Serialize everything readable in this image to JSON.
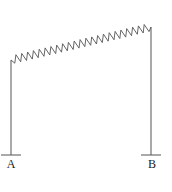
{
  "diagram": {
    "type": "spring-frame",
    "stroke_color": "#555555",
    "support_a": {
      "label": "A",
      "x": 11,
      "top_y": 60,
      "ground_y": 155
    },
    "support_b": {
      "label": "B",
      "x": 151,
      "top_y": 27,
      "ground_y": 155
    },
    "spring": {
      "teeth": 24,
      "amplitude": 4
    }
  }
}
